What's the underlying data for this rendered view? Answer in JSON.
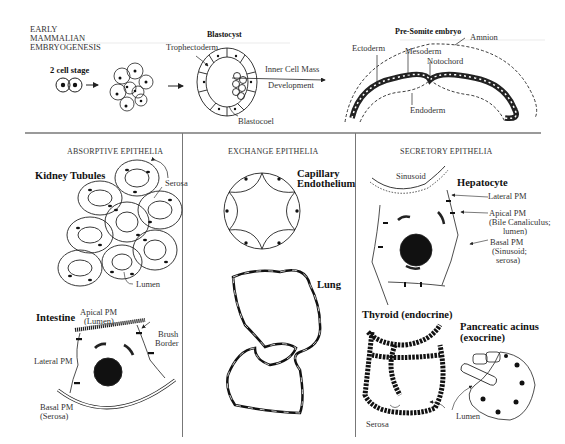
{
  "header": {
    "title_lines": [
      "EARLY",
      "MAMMALIAN",
      "EMBRYOGENESIS"
    ]
  },
  "embryogenesis": {
    "two_cell_label": "2 cell stage",
    "blastocyst": {
      "title": "Blastocyst",
      "trophectoderm": "Trophectoderm",
      "blastocoel": "Blastocoel",
      "inner_cell_mass": "Inner Cell Mass",
      "development": "Development"
    },
    "presomite": {
      "title": "Pre-Somite embryo",
      "amnion": "Amnion",
      "ectoderm": "Ectoderm",
      "mesoderm": "Mesoderm",
      "notochord": "Notochord",
      "endoderm": "Endoderm"
    }
  },
  "panels": {
    "absorptive": {
      "header": "ABSORPTIVE EPITHELIA",
      "kidney": {
        "title": "Kidney Tubules",
        "serosa": "Serosa",
        "lumen": "Lumen"
      },
      "intestine": {
        "title": "Intestine",
        "apical_1": "Apical PM",
        "apical_2": "(Lumen)",
        "brush_1": "Brush",
        "brush_2": "Border",
        "lateral": "Lateral PM",
        "basal_1": "Basal PM",
        "basal_2": "(Serosa)"
      }
    },
    "exchange": {
      "header": "EXCHANGE EPITHELIA",
      "capillary_1": "Capillary",
      "capillary_2": "Endothelium",
      "lung": "Lung"
    },
    "secretory": {
      "header": "SECRETORY EPITHELIA",
      "hepatocyte": {
        "title": "Hepatocyte",
        "sinusoid": "Sinusoid",
        "lateral": "Lateral PM",
        "apical_1": "Apical PM",
        "apical_2": "(Bile Canaliculus;",
        "apical_3": "lumen)",
        "basal_1": "Basal PM",
        "basal_2": "(Sinusoid;",
        "basal_3": "serosa)"
      },
      "thyroid": {
        "title": "Thyroid (endocrine)",
        "serosa": "Serosa",
        "lumen": "Lumen"
      },
      "pancreas": {
        "title_1": "Pancreatic acinus",
        "title_2": "(exocrine)"
      }
    }
  },
  "colors": {
    "ink": "#1a1a1a",
    "rule": "#9a9a9a",
    "background": "#ffffff"
  }
}
